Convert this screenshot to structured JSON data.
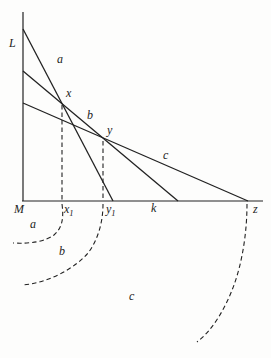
{
  "figure": {
    "width": 271,
    "height": 358,
    "background": "#fdfdfc",
    "ink": "#222222",
    "axis": {
      "vertical_label": "L",
      "vertical_label_x": 9,
      "vertical_label_y": 47,
      "origin_label": "M",
      "origin_label_x": 14,
      "origin_label_y": 213,
      "origin_x": 23,
      "origin_y": 201,
      "vertical_top_y": 12,
      "horizontal_end_x": 263
    },
    "budget_lines": [
      {
        "id": "a",
        "label": "a",
        "x1": 23,
        "y1": 29,
        "x2": 113,
        "y2": 201,
        "label_x": 57,
        "label_y": 63
      },
      {
        "id": "b",
        "label": "b",
        "x1": 23,
        "y1": 71,
        "x2": 178,
        "y2": 201,
        "label_x": 87,
        "label_y": 119
      },
      {
        "id": "c",
        "label": "c",
        "x1": 23,
        "y1": 103,
        "x2": 248,
        "y2": 201,
        "label_x": 163,
        "label_y": 159
      }
    ],
    "point_labels": [
      {
        "id": "x",
        "label": "x",
        "x": 66,
        "y": 97
      },
      {
        "id": "y",
        "label": "y",
        "x": 107,
        "y": 134
      }
    ],
    "drop_lines": [
      {
        "id": "x1-drop",
        "x": 62,
        "y1": 105,
        "y2": 200
      },
      {
        "id": "y1-drop",
        "x": 103,
        "y1": 141,
        "y2": 200
      }
    ],
    "axis_point_labels": [
      {
        "id": "x1",
        "base": "x",
        "sub": "1",
        "x": 64,
        "y": 213
      },
      {
        "id": "y1",
        "base": "y",
        "sub": "1",
        "x": 106,
        "y": 213
      },
      {
        "id": "k",
        "base": "k",
        "sub": "",
        "x": 151,
        "y": 212
      },
      {
        "id": "z",
        "base": "z",
        "sub": "",
        "x": 253,
        "y": 213
      }
    ],
    "dashed_curves": [
      {
        "id": "a",
        "label": "a",
        "path": "M62,204 C64,219 62,228 54,235 C46,241 32,244 13,243",
        "label_x": 30,
        "label_y": 228
      },
      {
        "id": "b",
        "label": "b",
        "path": "M103,204 C103,222 98,240 88,253 C76,267 50,283 22,285",
        "label_x": 59,
        "label_y": 255
      },
      {
        "id": "c",
        "label": "c",
        "path": "M247,204 C247,230 243,260 234,285 C226,307 213,330 197,342",
        "label_x": 129,
        "label_y": 300
      }
    ],
    "dash_pattern": "4.5,3",
    "line_width": 1.3,
    "axis_width": 1.2,
    "dash_width": 1.1
  }
}
